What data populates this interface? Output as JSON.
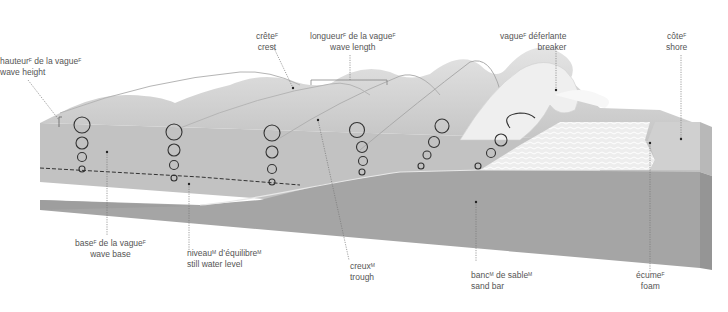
{
  "diagram": {
    "colors": {
      "water_surface": "#c9c9c9",
      "water_side": "#bdbdbd",
      "sand": "#a8a8a8",
      "sand_front": "#9c9c9c",
      "foam": "#ececec",
      "line": "#444444",
      "leader": "#777777",
      "text": "#555555"
    }
  },
  "labels": {
    "wave_height": {
      "fr": "hauteur",
      "fr_sup": "F",
      "fr_rest": " de la vague",
      "fr_rest_sup": "F",
      "en": "wave height"
    },
    "crest": {
      "fr": "crête",
      "fr_sup": "F",
      "en": "crest"
    },
    "wave_length": {
      "fr": "longueur",
      "fr_sup": "F",
      "fr_rest": " de la vague",
      "fr_rest_sup": "F",
      "en": "wave length"
    },
    "breaker": {
      "fr": "vague",
      "fr_sup": "F",
      "fr_rest": " déferlante",
      "en": "breaker"
    },
    "shore": {
      "fr": "côte",
      "fr_sup": "F",
      "en": "shore"
    },
    "wave_base": {
      "fr": "base",
      "fr_sup": "F",
      "fr_rest": " de la vague",
      "fr_rest_sup": "F",
      "en": "wave base"
    },
    "still_water_level": {
      "fr": "niveau",
      "fr_sup": "M",
      "fr_rest": " d’équilibre",
      "fr_rest_sup": "M",
      "en": "still water level"
    },
    "trough": {
      "fr": "creux",
      "fr_sup": "M",
      "en": "trough"
    },
    "sand_bar": {
      "fr": "banc",
      "fr_sup": "M",
      "fr_rest": " de sable",
      "fr_rest_sup": "M",
      "en": "sand bar"
    },
    "foam": {
      "fr": "écume",
      "fr_sup": "F",
      "en": "foam"
    }
  }
}
